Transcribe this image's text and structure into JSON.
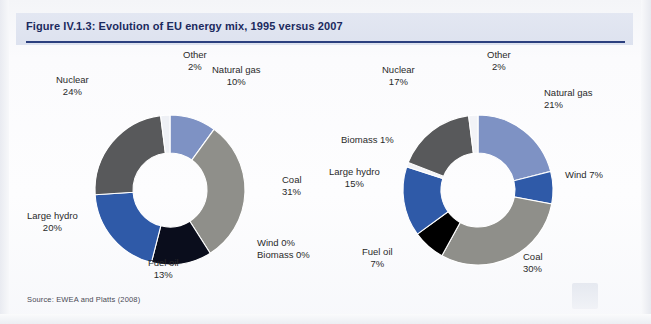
{
  "figure": {
    "title": "Figure IV.1.3: Evolution of EU energy mix, 1995 versus 2007",
    "source": "Source: EWEA and Platts (2008)",
    "accent_color": "#2b3f7e",
    "title_band_color": "#dfe3f0"
  },
  "chart_data": [
    {
      "type": "pie",
      "title": "1995",
      "donut": true,
      "center": [
        150,
        140
      ],
      "outer_radius": 75,
      "inner_radius": 37,
      "start_angle": -90,
      "categories": [
        "Natural gas",
        "Coal",
        "Wind",
        "Biomass",
        "Fuel oil",
        "Large hydro",
        "Nuclear",
        "Other"
      ],
      "values": [
        10,
        31,
        0,
        0,
        13,
        20,
        24,
        2
      ],
      "colors": [
        "#7e92c4",
        "#8f8f8a",
        "#9aa8cf",
        "#9aa8cf",
        "#0a0d1c",
        "#2f5aa8",
        "#58595b",
        "#eef0f5"
      ],
      "labels": [
        {
          "name": "Other",
          "value": "2%",
          "x": 163,
          "y": -1,
          "align": "center",
          "inline": false
        },
        {
          "name": "Natural gas",
          "value": "10%",
          "x": 192,
          "y": 14,
          "align": "center",
          "inline": false
        },
        {
          "name": "Nuclear",
          "value": "24%",
          "x": 36,
          "y": 24,
          "align": "center",
          "inline": false
        },
        {
          "name": "Coal",
          "value": "31%",
          "x": 262,
          "y": 124,
          "align": "left",
          "inline": false
        },
        {
          "name": "Wind",
          "value": "0%",
          "x": 237,
          "y": 187,
          "align": "left",
          "inline": true
        },
        {
          "name": "Biomass",
          "value": "0%",
          "x": 237,
          "y": 199,
          "align": "left",
          "inline": true
        },
        {
          "name": "Large hydro",
          "value": "20%",
          "x": 7,
          "y": 160,
          "align": "center",
          "inline": false
        },
        {
          "name": "Fuel oil",
          "value": "13%",
          "x": 128,
          "y": 207,
          "align": "center",
          "inline": false
        }
      ]
    },
    {
      "type": "pie",
      "title": "2007",
      "donut": true,
      "center": [
        158,
        140
      ],
      "outer_radius": 75,
      "inner_radius": 37,
      "start_angle": -90,
      "categories": [
        "Natural gas",
        "Wind",
        "Coal",
        "Fuel oil",
        "Large hydro",
        "Biomass",
        "Nuclear",
        "Other"
      ],
      "values": [
        21,
        7,
        30,
        7,
        15,
        1,
        17,
        2
      ],
      "colors": [
        "#7e92c4",
        "#2f5aa8",
        "#8f8f8a",
        "#000000",
        "#2f5aa8",
        "#f2f3f7",
        "#58595b",
        "#f2f3f7"
      ],
      "labels": [
        {
          "name": "Other",
          "value": "2%",
          "x": 167,
          "y": -1,
          "align": "center",
          "inline": false
        },
        {
          "name": "Nuclear",
          "value": "17%",
          "x": 62,
          "y": 14,
          "align": "center",
          "inline": false
        },
        {
          "name": "Natural gas",
          "value": "21%",
          "x": 224,
          "y": 37,
          "align": "left",
          "inline": false
        },
        {
          "name": "Wind",
          "value": "7%",
          "x": 245,
          "y": 119,
          "align": "left",
          "inline": true
        },
        {
          "name": "Coal",
          "value": "30%",
          "x": 203,
          "y": 201,
          "align": "left",
          "inline": false
        },
        {
          "name": "Fuel oil",
          "value": "7%",
          "x": 42,
          "y": 196,
          "align": "center",
          "inline": false
        },
        {
          "name": "Large hydro",
          "value": "15%",
          "x": 9,
          "y": 116,
          "align": "center",
          "inline": false
        },
        {
          "name": "Biomass",
          "value": "1%",
          "x": 21,
          "y": 84,
          "align": "left",
          "inline": true
        }
      ]
    }
  ]
}
